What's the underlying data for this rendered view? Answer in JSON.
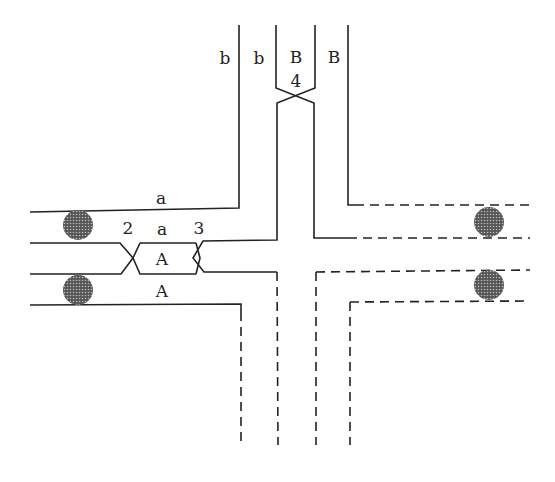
{
  "diagram": {
    "type": "chromosome-pairing-cross",
    "colors": {
      "line": "#222222",
      "background": "#ffffff",
      "knob": "#444444"
    },
    "labels": {
      "b_left": "b",
      "b_right": "b",
      "B_left": "B",
      "B_right": "B",
      "num_4": "4",
      "a_top": "a",
      "num_2": "2",
      "a_mid": "a",
      "num_3": "3",
      "A_mid": "A",
      "A_bottom": "A"
    },
    "knobs": [
      {
        "name": "knob-left-upper",
        "cx": 78,
        "cy": 225
      },
      {
        "name": "knob-left-lower",
        "cx": 78,
        "cy": 290
      },
      {
        "name": "knob-right-upper",
        "cx": 489,
        "cy": 222
      },
      {
        "name": "knob-right-lower",
        "cx": 489,
        "cy": 285
      }
    ]
  }
}
